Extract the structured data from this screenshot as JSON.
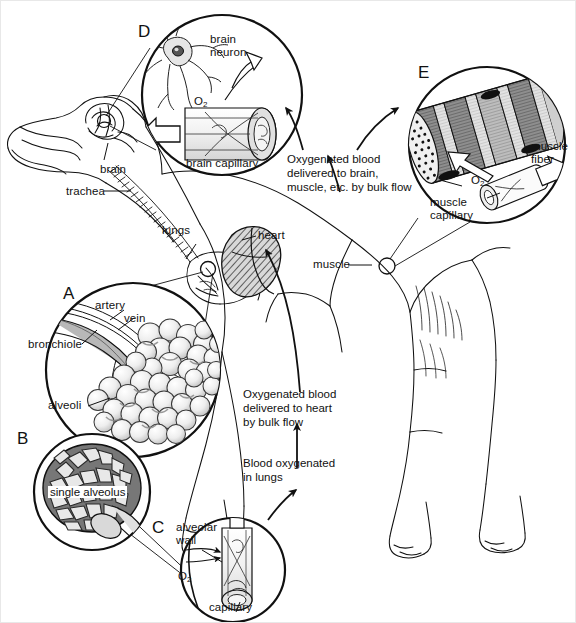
{
  "figure": {
    "background": "#ffffff",
    "ink": "#111111",
    "width": 575,
    "height": 622
  },
  "panels": [
    {
      "id": "A",
      "letter": "A",
      "caption": "alveoli cluster with bronchiole, artery and vein"
    },
    {
      "id": "B",
      "letter": "B",
      "caption": "single alveolus with capillary network"
    },
    {
      "id": "C",
      "letter": "C",
      "caption": "alveolar wall and capillary gas exchange"
    },
    {
      "id": "D",
      "letter": "D",
      "caption": "brain neuron and brain capillary"
    },
    {
      "id": "E",
      "letter": "E",
      "caption": "muscle fiber and muscle capillary"
    }
  ],
  "anatomy_labels": {
    "brain": "brain",
    "trachea": "trachea",
    "lungs": "lungs",
    "heart": "heart",
    "muscle": "muscle"
  },
  "panel_a_labels": {
    "artery": "artery",
    "vein": "vein",
    "bronchiole": "bronchiole",
    "alveoli": "alveoli"
  },
  "panel_b_labels": {
    "single_alveolus": "single alveolus"
  },
  "panel_c_labels": {
    "alveolar_wall": "alveolar\nwall",
    "oxygen": "O",
    "oxygen_sub": "2",
    "capillary": "capillary"
  },
  "panel_d_labels": {
    "brain_neuron": "brain\nneuron",
    "oxygen": "O",
    "oxygen_sub": "2",
    "brain_capillary": "brain capillary"
  },
  "panel_e_labels": {
    "muscle_fiber": "muscle\nfiber",
    "oxygen": "O",
    "oxygen_sub": "2",
    "muscle_capillary": "muscle\ncapillary"
  },
  "flow_texts": [
    {
      "name": "oxygenated-blood-to-body",
      "text": "Oxygenated blood\ndelivered to brain,\nmuscle, etc. by bulk flow"
    },
    {
      "name": "oxygenated-blood-to-heart",
      "text": "Oxygenated blood\ndelivered to heart\nby bulk flow"
    },
    {
      "name": "blood-oxygenated-in-lungs",
      "text": "Blood oxygenated\nin lungs"
    }
  ]
}
